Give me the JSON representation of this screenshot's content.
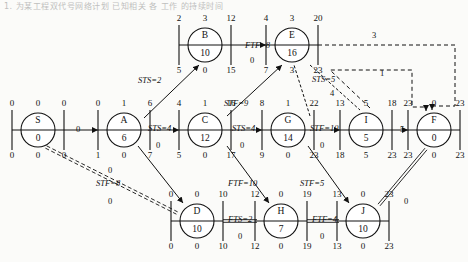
{
  "header": {
    "caption": "1. 为某工程双代号网络计划 已知相关 各 工作 的持续时间"
  },
  "diagram": {
    "type": "precedence-network",
    "legend": {
      "box_top": [
        "ES",
        "FF/slack",
        "EF"
      ],
      "box_bottom": [
        "LS",
        "TF",
        "LF"
      ]
    },
    "nodes": [
      {
        "id": "S",
        "name": "S",
        "duration": "0",
        "top": [
          "0",
          "0",
          "0"
        ],
        "bottom": [
          "0",
          "0",
          "0"
        ],
        "cx": 38,
        "cy": 130
      },
      {
        "id": "A",
        "name": "A",
        "duration": "6",
        "top": [
          "0",
          "1",
          "6"
        ],
        "bottom": [
          "1",
          "0",
          "7"
        ],
        "cx": 124,
        "cy": 130
      },
      {
        "id": "C",
        "name": "C",
        "duration": "12",
        "top": [
          "4",
          "1",
          "16"
        ],
        "bottom": [
          "5",
          "0",
          "17"
        ],
        "cx": 205,
        "cy": 130
      },
      {
        "id": "G",
        "name": "G",
        "duration": "14",
        "top": [
          "8",
          "1",
          "22"
        ],
        "bottom": [
          "9",
          "0",
          "23"
        ],
        "cx": 288,
        "cy": 130
      },
      {
        "id": "I",
        "name": "I",
        "duration": "5",
        "top": [
          "13",
          "5",
          "18"
        ],
        "bottom": [
          "18",
          "5",
          "23"
        ],
        "cx": 366,
        "cy": 130
      },
      {
        "id": "F",
        "name": "F",
        "duration": "0",
        "top": [
          "23",
          "0",
          "23"
        ],
        "bottom": [
          "23",
          "0",
          "23"
        ],
        "cx": 434,
        "cy": 130
      },
      {
        "id": "B",
        "name": "B",
        "duration": "10",
        "top": [
          "2",
          "3",
          "12"
        ],
        "bottom": [
          "5",
          "0",
          "15"
        ],
        "cx": 205,
        "cy": 45
      },
      {
        "id": "E",
        "name": "E",
        "duration": "16",
        "top": [
          "4",
          "3",
          "20"
        ],
        "bottom": [
          "7",
          "3",
          "23"
        ],
        "cx": 292,
        "cy": 45
      },
      {
        "id": "D",
        "name": "D",
        "duration": "10",
        "top": [
          "0",
          "0",
          "10"
        ],
        "bottom": [
          "0",
          "0",
          "10"
        ],
        "cx": 197,
        "cy": 221
      },
      {
        "id": "H",
        "name": "H",
        "duration": "7",
        "top": [
          "12",
          "0",
          "19"
        ],
        "bottom": [
          "12",
          "0",
          "19"
        ],
        "cx": 281,
        "cy": 221
      },
      {
        "id": "J",
        "name": "J",
        "duration": "10",
        "top": [
          "13",
          "0",
          "23"
        ],
        "bottom": [
          "13",
          "0",
          "23"
        ],
        "cx": 363,
        "cy": 221
      }
    ],
    "edges": [
      {
        "from": "S",
        "to": "A",
        "label": "0",
        "style": "solid-thin"
      },
      {
        "from": "A",
        "to": "C",
        "label": "STS=4",
        "style": "solid-thin",
        "under": "0"
      },
      {
        "from": "C",
        "to": "G",
        "label": "STS=4",
        "style": "solid-thin",
        "under": "0"
      },
      {
        "from": "G",
        "to": "I",
        "label": "STF=10",
        "style": "solid-thin",
        "under": "0"
      },
      {
        "from": "I",
        "to": "F",
        "label": "5",
        "style": "solid-thin"
      },
      {
        "from": "A",
        "to": "B",
        "label": "STS=2",
        "style": "solid-thin"
      },
      {
        "from": "B",
        "to": "E",
        "label": "FTF=8",
        "style": "solid-thin",
        "under": "0"
      },
      {
        "from": "C",
        "to": "E",
        "label": "STF=9",
        "style": "solid-thin"
      },
      {
        "from": "A",
        "to": "D",
        "label": "STF=8",
        "style": "solid-thin"
      },
      {
        "from": "S",
        "to": "D",
        "label": "0",
        "style": "double-dashed"
      },
      {
        "from": "C",
        "to": "H",
        "label": "FTF=10",
        "style": "solid-thin"
      },
      {
        "from": "D",
        "to": "H",
        "label": "FTS=2",
        "style": "double",
        "under": "0"
      },
      {
        "from": "H",
        "to": "J",
        "label": "FTF=4",
        "style": "double",
        "under": "0"
      },
      {
        "from": "G",
        "to": "I",
        "label": "STS=5",
        "style": "dashed-diag",
        "under": "4"
      },
      {
        "from": "J",
        "to": "F",
        "label": "0",
        "style": "double"
      },
      {
        "from": "E",
        "to": "F",
        "label": "3",
        "style": "dashed-ortho"
      },
      {
        "from": "I",
        "to": "F",
        "label": "1",
        "style": "dashed-ortho"
      }
    ],
    "edge_labels": [
      {
        "text": "STS=2",
        "x": 138,
        "y": 75,
        "italic": true
      },
      {
        "text": "FTF=8",
        "x": 245,
        "y": 40,
        "italic": true
      },
      {
        "text": "0",
        "x": 250,
        "y": 55,
        "italic": false
      },
      {
        "text": "STF=9",
        "x": 224,
        "y": 98,
        "italic": true
      },
      {
        "text": "STS=4",
        "x": 148,
        "y": 123,
        "italic": true
      },
      {
        "text": "0",
        "x": 156,
        "y": 140,
        "italic": false
      },
      {
        "text": "STS=4",
        "x": 232,
        "y": 123,
        "italic": true
      },
      {
        "text": "0",
        "x": 240,
        "y": 140,
        "italic": false
      },
      {
        "text": "STF=10",
        "x": 310,
        "y": 123,
        "italic": true
      },
      {
        "text": "0",
        "x": 320,
        "y": 140,
        "italic": false
      },
      {
        "text": "0",
        "x": 76,
        "y": 124,
        "italic": false
      },
      {
        "text": "5",
        "x": 400,
        "y": 124,
        "italic": false
      },
      {
        "text": "STF=8",
        "x": 96,
        "y": 178,
        "italic": true
      },
      {
        "text": "0",
        "x": 108,
        "y": 165,
        "italic": false
      },
      {
        "text": "FTF=10",
        "x": 228,
        "y": 178,
        "italic": true
      },
      {
        "text": "FTS=2",
        "x": 228,
        "y": 214,
        "italic": true
      },
      {
        "text": "0",
        "x": 238,
        "y": 231,
        "italic": false
      },
      {
        "text": "FTF=4",
        "x": 312,
        "y": 214,
        "italic": true
      },
      {
        "text": "0",
        "x": 320,
        "y": 231,
        "italic": false
      },
      {
        "text": "STF=5",
        "x": 300,
        "y": 178,
        "italic": true
      },
      {
        "text": "STS=5",
        "x": 312,
        "y": 74,
        "italic": true
      },
      {
        "text": "4",
        "x": 330,
        "y": 88,
        "italic": false
      },
      {
        "text": "3",
        "x": 372,
        "y": 30,
        "italic": false
      },
      {
        "text": "1",
        "x": 380,
        "y": 68,
        "italic": false
      },
      {
        "text": "0",
        "x": 108,
        "y": 196,
        "italic": false
      },
      {
        "text": "0",
        "x": 404,
        "y": 196,
        "italic": false
      }
    ]
  }
}
